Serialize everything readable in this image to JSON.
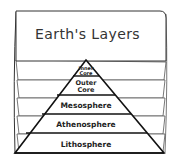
{
  "title": "Earth's Layers",
  "layers": [
    {
      "line1": "Inner",
      "line2": "Core"
    },
    {
      "line1": "Outer",
      "line2": "Core"
    },
    {
      "label": "Mesosphere"
    },
    {
      "label": "Athenosphere"
    },
    {
      "label": "Lithosphere"
    }
  ],
  "colors": {
    "stroke": "#222222",
    "paper": "#ffffff",
    "sheet_line": "#555555"
  }
}
